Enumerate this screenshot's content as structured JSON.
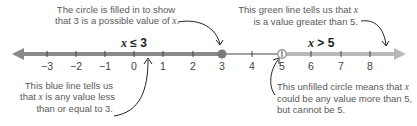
{
  "diagram": {
    "type": "number-line",
    "ticks": [
      "−3",
      "−2",
      "−1",
      "0",
      "1",
      "2",
      "3",
      "4",
      "5",
      "6",
      "7",
      "8"
    ],
    "inequalities": {
      "left": {
        "variable": "x",
        "operator": "≤",
        "value": "3"
      },
      "right": {
        "variable": "x",
        "operator": ">",
        "value": "5"
      }
    },
    "points": {
      "closed_circle_at": 3,
      "open_circle_at": 5
    },
    "colors": {
      "left_line": "#8a8a8a",
      "right_line": "#b9b9b9",
      "middle_line": "#444444",
      "closed_circle": "#7a7a7a",
      "open_circle_stroke": "#9a9a9a",
      "annotation_arrow": "#222222",
      "text": "#5a5a5a"
    },
    "annotations": {
      "top_left": {
        "line1": "The circle is filled in to show",
        "line2_pre": "that 3 is a possible value of ",
        "line2_var": "x",
        "line2_post": "."
      },
      "top_right": {
        "line1_pre": "This green line tells us that ",
        "line1_var": "x",
        "line2": "is a value greater than 5."
      },
      "bottom_left": {
        "line1": "This blue line tells us",
        "line2_pre": "that ",
        "line2_var": "x",
        "line2_post": " is any value less",
        "line3": "than or equal to 3."
      },
      "bottom_right": {
        "line1_pre": "This unfilled circle means that ",
        "line1_var": "x",
        "line2": "could be any value more than 5,",
        "line3": "but cannot be 5."
      }
    }
  }
}
